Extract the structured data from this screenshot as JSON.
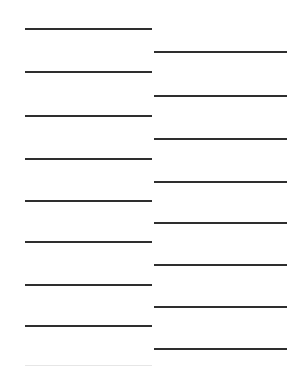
{
  "page": {
    "corner_text": "",
    "line_color": "#2e2e2e",
    "background": "#ffffff"
  },
  "left_column": {
    "lines_y": [
      29,
      72,
      116,
      159,
      201,
      242,
      285,
      326
    ],
    "faint_lines_y": [
      366
    ]
  },
  "right_column": {
    "lines_y": [
      52,
      96,
      139,
      182,
      223,
      265,
      307,
      349
    ]
  }
}
